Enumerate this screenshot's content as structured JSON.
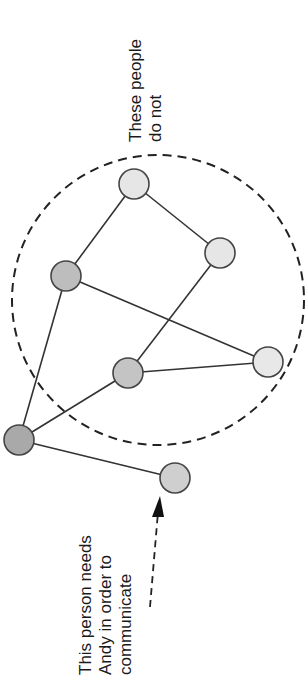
{
  "annotations": {
    "top": {
      "line1": "These people",
      "line2": "do not"
    },
    "bottom": {
      "line1": "This person needs",
      "line2": "Andy in order to",
      "line3": "communicate"
    }
  },
  "diagram": {
    "boundary": {
      "style": "dashed",
      "cx": 158,
      "cy": 300,
      "rx": 146,
      "ry": 145
    },
    "nodes": [
      {
        "id": "andy",
        "name": "Andy",
        "x": 19,
        "y": 440,
        "fill": "#a9a9a9"
      },
      {
        "id": "n-left",
        "x": 66,
        "y": 276,
        "fill": "#bdbdbd"
      },
      {
        "id": "n-mid",
        "x": 128,
        "y": 373,
        "fill": "#c4c4c4"
      },
      {
        "id": "n-top",
        "x": 134,
        "y": 184,
        "fill": "#e6e6e6"
      },
      {
        "id": "n-right",
        "x": 220,
        "y": 253,
        "fill": "#e6e6e6"
      },
      {
        "id": "n-farright",
        "x": 268,
        "y": 362,
        "fill": "#e8e8e8"
      },
      {
        "id": "n-bottom",
        "x": 175,
        "y": 478,
        "fill": "#cfcfcf"
      }
    ],
    "edges": [
      [
        "andy",
        "n-left"
      ],
      [
        "andy",
        "n-mid"
      ],
      [
        "andy",
        "n-bottom"
      ],
      [
        "n-left",
        "n-top"
      ],
      [
        "n-top",
        "n-right"
      ],
      [
        "n-right",
        "n-mid"
      ],
      [
        "n-left",
        "n-farright"
      ],
      [
        "n-mid",
        "n-farright"
      ]
    ]
  }
}
